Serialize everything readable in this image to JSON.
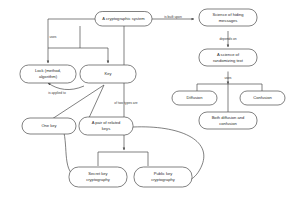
{
  "diagram": {
    "type": "concept-map",
    "stroke_color": "#4a4a4a",
    "text_color": "#2b2b2b",
    "background_color": "#ffffff",
    "nodes": [
      {
        "id": "crypto-system",
        "label_line1": "A cryptographic system",
        "label_line2": ""
      },
      {
        "id": "science-hiding",
        "label_line1": "Science of hiding",
        "label_line2": "messages"
      },
      {
        "id": "science-random",
        "label_line1": "A science of",
        "label_line2": "randomizing text"
      },
      {
        "id": "diffusion",
        "label_line1": "Diffusion",
        "label_line2": ""
      },
      {
        "id": "confusion",
        "label_line1": "Confusion",
        "label_line2": ""
      },
      {
        "id": "both-diffusion-confusion",
        "label_line1": "Both diffusion and",
        "label_line2": "confusion"
      },
      {
        "id": "lock",
        "label_line1": "Lock (method,",
        "label_line2": "algorithm)"
      },
      {
        "id": "key",
        "label_line1": "Key",
        "label_line2": ""
      },
      {
        "id": "one-key",
        "label_line1": "One key",
        "label_line2": ""
      },
      {
        "id": "pair-related-keys",
        "label_line1": "A pair of related",
        "label_line2": "keys"
      },
      {
        "id": "secret-key-crypto",
        "label_line1": "Secret key",
        "label_line2": "cryptography"
      },
      {
        "id": "public-key-crypto",
        "label_line1": "Public key",
        "label_line2": "cryptography"
      }
    ],
    "edge_labels": [
      {
        "id": "is-built-upon",
        "text": "is built upon"
      },
      {
        "id": "depends-on",
        "text": "depends on"
      },
      {
        "id": "uses-random",
        "text": "uses"
      },
      {
        "id": "uses-system",
        "text": "uses"
      },
      {
        "id": "is-applied-to",
        "text": "is applied to"
      },
      {
        "id": "of-two-types-are",
        "text": "of two types are"
      }
    ]
  }
}
